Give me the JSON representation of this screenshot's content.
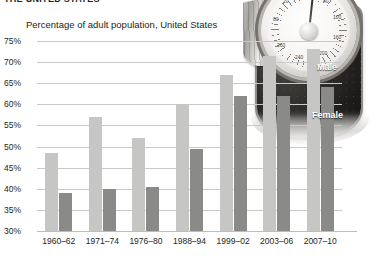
{
  "headline": "THE UNITED STATES",
  "subtitle": "Percentage of adult population, United States",
  "legend": {
    "male": "Male",
    "female": "Female"
  },
  "axis": {
    "y_ticks": [
      "75%",
      "70%",
      "65%",
      "60%",
      "55%",
      "50%",
      "45%",
      "40%",
      "35%",
      "30%"
    ],
    "x_categories": [
      "1960–62",
      "1971–74",
      "1976–80",
      "1988–94",
      "1999–02",
      "2003–06",
      "2007–10"
    ]
  },
  "colors": {
    "male_bar": "#c6c6c4",
    "female_bar": "#8a8a88",
    "gridline": "#c9c9c9",
    "text": "#231f20",
    "legend_text": "#ffffff"
  },
  "chart_data": {
    "type": "bar",
    "title": "THE UNITED STATES",
    "subtitle": "Percentage of adult population, United States",
    "categories": [
      "1960–62",
      "1971–74",
      "1976–80",
      "1988–94",
      "1999–02",
      "2003–06",
      "2007–10"
    ],
    "series": [
      {
        "name": "Male",
        "values": [
          48.5,
          57.0,
          52.0,
          60.0,
          67.0,
          71.5,
          73.0
        ]
      },
      {
        "name": "Female",
        "values": [
          39.0,
          40.0,
          40.5,
          49.5,
          62.0,
          62.0,
          64.0
        ]
      }
    ],
    "xlabel": "",
    "ylabel": "Percentage of adult population",
    "ylim": [
      30,
      75
    ],
    "ytick_step": 5,
    "grid": true,
    "legend_position": "overlay-right"
  }
}
